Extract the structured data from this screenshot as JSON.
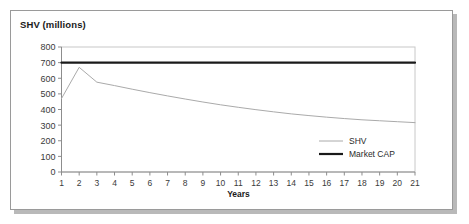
{
  "figure": {
    "title": "SHV (millions)",
    "xaxis_title": "Years",
    "background_color": "#ffffff",
    "frame_color": "#9a9a9a",
    "shadow_color": "#b9b9b9"
  },
  "legend": {
    "entries": [
      {
        "label": "SHV",
        "color": "#aaaaaa"
      },
      {
        "label": "Market CAP",
        "color": "#1a1a1a"
      }
    ]
  },
  "chart_data": {
    "type": "line",
    "title": "SHV (millions)",
    "xlabel": "Years",
    "ylabel": "SHV (millions)",
    "xlim": [
      1,
      21
    ],
    "ylim": [
      0,
      800
    ],
    "grid": false,
    "legend_position": "bottom-right",
    "x": [
      1,
      2,
      3,
      4,
      5,
      6,
      7,
      8,
      9,
      10,
      11,
      12,
      13,
      14,
      15,
      16,
      17,
      18,
      19,
      20,
      21
    ],
    "xticks": [
      "1",
      "2",
      "3",
      "4",
      "5",
      "6",
      "7",
      "8",
      "9",
      "10",
      "11",
      "12",
      "13",
      "14",
      "15",
      "16",
      "17",
      "18",
      "19",
      "20",
      "21"
    ],
    "yticks": [
      "0",
      "100",
      "200",
      "300",
      "400",
      "500",
      "600",
      "700",
      "800"
    ],
    "ytick_values": [
      0,
      100,
      200,
      300,
      400,
      500,
      600,
      700,
      800
    ],
    "series": [
      {
        "name": "SHV",
        "color": "#aaaaaa",
        "width": 1,
        "values": [
          470,
          670,
          575,
          553,
          530,
          508,
          487,
          467,
          448,
          430,
          414,
          399,
          385,
          372,
          361,
          351,
          342,
          334,
          328,
          322,
          316
        ]
      },
      {
        "name": "Market CAP",
        "color": "#1a1a1a",
        "width": 2.2,
        "values": [
          700,
          700,
          700,
          700,
          700,
          700,
          700,
          700,
          700,
          700,
          700,
          700,
          700,
          700,
          700,
          700,
          700,
          700,
          700,
          700,
          700
        ]
      }
    ]
  }
}
